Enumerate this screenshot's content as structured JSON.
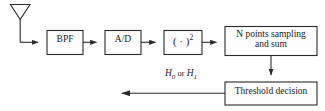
{
  "diagram": {
    "stroke_color": "#2b2b2b",
    "fill_color": "#fdfdfd",
    "background_color": "#fefefe",
    "antenna": {
      "name": "receive-antenna",
      "label": ""
    },
    "blocks": [
      {
        "id": "bpf",
        "label": "BPF"
      },
      {
        "id": "ad",
        "label": "A/D"
      },
      {
        "id": "square",
        "label": "( · )",
        "superscript": "2"
      },
      {
        "id": "npoints",
        "label": "N points sampling\nand sum"
      },
      {
        "id": "threshold",
        "label": "Threshold decision"
      }
    ],
    "output": {
      "h0": "H",
      "h0_sub": "0",
      "conjunction": " or ",
      "h1": "H",
      "h1_sub": "1"
    },
    "connections": [
      {
        "from": "antenna",
        "to": "bpf"
      },
      {
        "from": "bpf",
        "to": "ad"
      },
      {
        "from": "ad",
        "to": "square"
      },
      {
        "from": "square",
        "to": "npoints"
      },
      {
        "from": "npoints",
        "to": "threshold"
      },
      {
        "from": "threshold",
        "to": "output"
      }
    ]
  }
}
